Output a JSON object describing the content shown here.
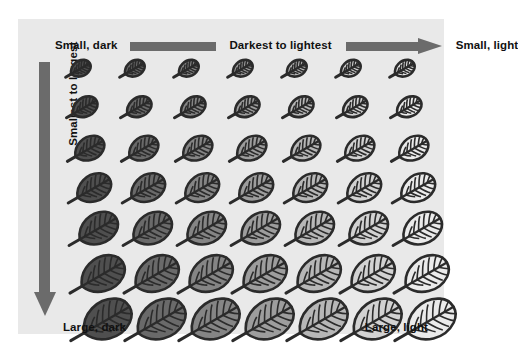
{
  "figure": {
    "panel_background": "#e9e9e9",
    "page_background": "#ffffff"
  },
  "labels": {
    "top_left": "Small, dark",
    "top_middle": "Darkest to lightest",
    "top_right": "Small, light",
    "left_vertical": "Smallest to largest",
    "bottom_left": "Large, dark",
    "bottom_right": "Large, light"
  },
  "arrows": {
    "horizontal_bar_color": "#6b6b6b",
    "vertical_arrow_color": "#6b6b6b",
    "horizontal_direction": "right",
    "vertical_direction": "down"
  },
  "chart_data": {
    "type": "heatmap",
    "xlabel": "Darkest to lightest",
    "ylabel": "Smallest to largest",
    "legend": [],
    "grid": false,
    "rows": 7,
    "columns": 7,
    "row_label_top": "Smallest",
    "row_label_bottom": "Largest",
    "column_label_left": "Darkest",
    "column_label_right": "Lightest",
    "x": [
      1,
      2,
      3,
      4,
      5,
      6,
      7
    ],
    "y": [
      1,
      2,
      3,
      4,
      5,
      6,
      7
    ],
    "leaf_sizes_px": [
      21,
      26,
      31,
      36,
      41,
      46,
      51
    ],
    "leaf_fill_colors": [
      "#4f4f4f",
      "#6a6a6a",
      "#858585",
      "#9d9d9d",
      "#b7b7b7",
      "#d2d2d2",
      "#ebebeb"
    ],
    "leaf_outline_color": "#2b2b2b",
    "row_y_offsets_px": [
      0,
      36,
      75,
      112,
      150,
      193,
      236
    ],
    "cells": [
      {
        "row": 1,
        "size_px": 21,
        "colors": [
          "#4f4f4f",
          "#6a6a6a",
          "#858585",
          "#9d9d9d",
          "#b7b7b7",
          "#d2d2d2",
          "#ebebeb"
        ]
      },
      {
        "row": 2,
        "size_px": 26,
        "colors": [
          "#4f4f4f",
          "#6a6a6a",
          "#858585",
          "#9d9d9d",
          "#b7b7b7",
          "#d2d2d2",
          "#ebebeb"
        ]
      },
      {
        "row": 3,
        "size_px": 31,
        "colors": [
          "#4f4f4f",
          "#6a6a6a",
          "#858585",
          "#9d9d9d",
          "#b7b7b7",
          "#d2d2d2",
          "#ebebeb"
        ]
      },
      {
        "row": 4,
        "size_px": 36,
        "colors": [
          "#4f4f4f",
          "#6a6a6a",
          "#858585",
          "#9d9d9d",
          "#b7b7b7",
          "#d2d2d2",
          "#ebebeb"
        ]
      },
      {
        "row": 5,
        "size_px": 41,
        "colors": [
          "#4f4f4f",
          "#6a6a6a",
          "#858585",
          "#9d9d9d",
          "#b7b7b7",
          "#d2d2d2",
          "#ebebeb"
        ]
      },
      {
        "row": 6,
        "size_px": 46,
        "colors": [
          "#4f4f4f",
          "#6a6a6a",
          "#858585",
          "#9d9d9d",
          "#b7b7b7",
          "#d2d2d2",
          "#ebebeb"
        ]
      },
      {
        "row": 7,
        "size_px": 51,
        "colors": [
          "#4f4f4f",
          "#6a6a6a",
          "#858585",
          "#9d9d9d",
          "#b7b7b7",
          "#d2d2d2",
          "#ebebeb"
        ]
      }
    ]
  }
}
